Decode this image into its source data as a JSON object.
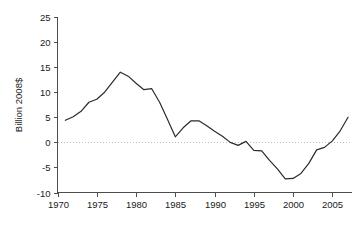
{
  "chart_data": {
    "type": "line",
    "title": "",
    "xlabel": "",
    "ylabel": "Billion 2008$",
    "xlim": [
      1970,
      2007.5
    ],
    "ylim": [
      -10,
      25
    ],
    "grid": false,
    "legend": null,
    "zero_reference_line": true,
    "line_color": "#2b2b2b",
    "zero_line_color": "#bfbfbf",
    "axis_color": "#4d4d4d",
    "xticks": [
      1970,
      1975,
      1980,
      1985,
      1990,
      1995,
      2000,
      2005
    ],
    "xtick_labels": [
      "1970",
      "1975",
      "1980",
      "1985",
      "1990",
      "1995",
      "2000",
      "2005"
    ],
    "yticks": [
      -10,
      -5,
      0,
      5,
      10,
      15,
      20,
      25
    ],
    "ytick_labels": [
      "-10",
      "-5",
      "0",
      "5",
      "10",
      "15",
      "20",
      "25"
    ],
    "x": [
      1971,
      1972,
      1973,
      1974,
      1975,
      1976,
      1977,
      1978,
      1979,
      1980,
      1981,
      1982,
      1983,
      1984,
      1985,
      1986,
      1987,
      1988,
      1989,
      1990,
      1991,
      1992,
      1993,
      1994,
      1995,
      1996,
      1997,
      1998,
      1999,
      2000,
      2001,
      2002,
      2003,
      2004,
      2005,
      2006,
      2007
    ],
    "values": [
      4.4,
      5.1,
      6.2,
      8.0,
      8.6,
      10.0,
      12.0,
      14.0,
      13.2,
      11.8,
      10.5,
      10.7,
      8.0,
      4.6,
      1.1,
      2.9,
      4.3,
      4.3,
      3.3,
      2.2,
      1.2,
      0.0,
      -0.6,
      0.2,
      -1.6,
      -1.7,
      -3.6,
      -5.3,
      -7.3,
      -7.2,
      -6.2,
      -4.2,
      -1.5,
      -1.0,
      0.3,
      2.3,
      5.0
    ],
    "series_name": "value"
  },
  "figure": {
    "name": "line-chart",
    "y_axis_label": "Billion 2008$"
  }
}
